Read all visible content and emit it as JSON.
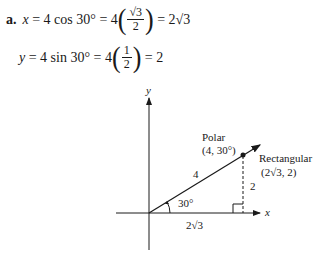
{
  "part_a": {
    "label": "a.",
    "line1": {
      "lhs": "x",
      "expr": "= 4 cos 30° = 4",
      "frac_num": "√3",
      "frac_den": "2",
      "result": "= 2√3"
    },
    "line2": {
      "lhs": "y",
      "expr": "= 4 sin 30° = 4",
      "frac_num": "1",
      "frac_den": "2",
      "result": "= 2"
    }
  },
  "diagram": {
    "x_axis_label": "x",
    "y_axis_label": "y",
    "polar_label": "Polar",
    "polar_coords": "(4, 30°)",
    "rect_label": "Rectangular",
    "rect_coords": "(2√3, 2)",
    "radius_label": "4",
    "angle_label": "30°",
    "height_label": "2",
    "base_label": "2√3"
  }
}
